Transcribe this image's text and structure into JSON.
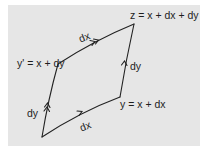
{
  "diagram": {
    "background_color": "#e6e6e6",
    "line_color": "#222222",
    "vertices": {
      "x": {
        "x": 42,
        "y": 137
      },
      "y_prime": {
        "x": 58,
        "y": 64
      },
      "z": {
        "x": 134,
        "y": 24
      },
      "y": {
        "x": 120,
        "y": 97
      }
    },
    "labels": {
      "z": "z = x + dx + dy",
      "y_prime": "y' = x + dy",
      "y": "y = x + dx",
      "top_edge": "dx",
      "bottom_edge": "dx",
      "left_edge": "dy",
      "right_edge": "dy"
    },
    "edges": [
      {
        "name": "left-edge",
        "from": "x",
        "to": "y_prime",
        "label": "dy",
        "arrows": 2
      },
      {
        "name": "top-edge",
        "from": "y_prime",
        "to": "z",
        "label": "dx",
        "arrows": 2
      },
      {
        "name": "bottom-edge",
        "from": "x",
        "to": "y",
        "label": "dx",
        "arrows": 1
      },
      {
        "name": "right-edge",
        "from": "y",
        "to": "z",
        "label": "dy",
        "arrows": 1
      }
    ]
  }
}
